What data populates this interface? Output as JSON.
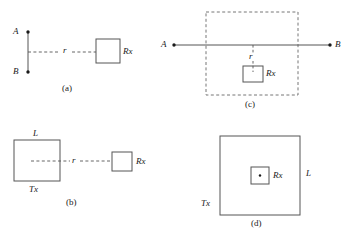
{
  "figure": {
    "background_color": "#ffffff",
    "stroke_color": "#555555",
    "text_color": "#1a1a1a",
    "panels": [
      {
        "id": "a",
        "caption": "(a)",
        "description": "Vertical dipole A-B with dashed separation r to a small Rx box",
        "labels": {
          "terminal_top": "A",
          "terminal_bottom": "B",
          "distance": "r",
          "receiver": "Rx"
        }
      },
      {
        "id": "b",
        "caption": "(b)",
        "description": "Large square transmitter aperture of side L, dashed separation r to a small Rx box",
        "labels": {
          "aperture_side": "L",
          "transmitter": "Tx",
          "distance": "r",
          "receiver": "Rx"
        }
      },
      {
        "id": "c",
        "caption": "(c)",
        "description": "Horizontal dipole A-B crossing a dashed near-field boundary, with vertical dashed offset r down to a small Rx box",
        "labels": {
          "terminal_left": "A",
          "terminal_right": "B",
          "distance": "r",
          "receiver": "Rx"
        }
      },
      {
        "id": "d",
        "caption": "(d)",
        "description": "Large square transmitter aperture of side L with a small Rx box containing a point at its centre",
        "labels": {
          "aperture_side": "L",
          "transmitter": "Tx",
          "receiver": "Rx"
        }
      }
    ]
  }
}
